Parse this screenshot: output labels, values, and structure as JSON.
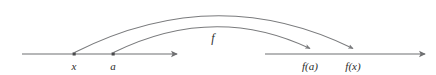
{
  "figure": {
    "kind": "function-mapping-diagram",
    "colors": {
      "background": "#ffffff",
      "stroke": "#6f7072",
      "arc_stroke": "#7a7b7d",
      "point_fill": "#4a4a4c",
      "text": "#2b2b2b"
    },
    "domain_axis": {
      "name": "domain-number-line",
      "x_start": 22,
      "x_end": 177,
      "y": 54
    },
    "codomain_axis": {
      "name": "codomain-number-line",
      "x_start": 265,
      "x_end": 425,
      "y": 54
    },
    "points": [
      {
        "id": "x",
        "label": "x",
        "cx": 74,
        "cy": 54,
        "label_x": 74,
        "label_y": 61
      },
      {
        "id": "a",
        "label": "a",
        "cx": 113,
        "cy": 54,
        "label_x": 113,
        "label_y": 61
      },
      {
        "id": "fa",
        "label": "f(a)",
        "cx": 310,
        "cy": 54,
        "label_x": 310,
        "label_y": 61
      },
      {
        "id": "fx",
        "label": "f(x)",
        "cx": 353,
        "cy": 54,
        "label_x": 353,
        "label_y": 61
      }
    ],
    "arcs": [
      {
        "id": "arc-x-to-fx",
        "from": "x",
        "to": "fx",
        "apex_x": 216,
        "apex_y": 5
      },
      {
        "id": "arc-a-to-fa",
        "from": "a",
        "to": "fa",
        "apex_x": 214,
        "apex_y": 23
      }
    ],
    "map_label": {
      "text": "f",
      "x": 213,
      "y": 32
    }
  }
}
